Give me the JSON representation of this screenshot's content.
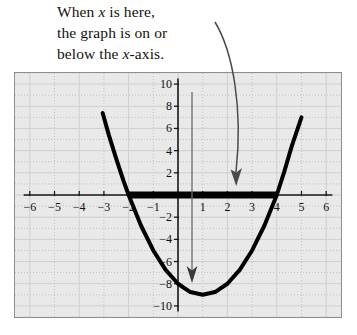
{
  "annotation": {
    "line1_pre": "When ",
    "line1_var": "x",
    "line1_post": " is here,",
    "line2": "the graph is on or",
    "line3_pre": "below the ",
    "line3_var": "x",
    "line3_post": "-axis.",
    "curved_arrow_name": "curved-callout-arrow",
    "vertex_arrow_name": "vertex-pointer-arrow"
  },
  "chart_data": {
    "type": "line",
    "title": "",
    "xlabel": "",
    "ylabel": "",
    "xlim": [
      -6.6,
      6.6
    ],
    "ylim": [
      -11,
      11
    ],
    "grid": true,
    "minor_grid_step": 1,
    "major_grid_step": 2,
    "legend": "none",
    "x_ticks": [
      -6,
      -5,
      -4,
      -3,
      -2,
      -1,
      1,
      2,
      3,
      4,
      5,
      6
    ],
    "x_tick_labels": [
      "−6",
      "−5",
      "−4",
      "−3",
      "−2",
      "−1",
      "1",
      "2",
      "3",
      "4",
      "5",
      "6"
    ],
    "y_ticks": [
      10,
      8,
      6,
      4,
      2,
      -2,
      -4,
      -6,
      -8,
      -10
    ],
    "y_tick_labels": [
      "10",
      "8",
      "6",
      "4",
      "2",
      "−2",
      "−4",
      "−6",
      "−8",
      "−10"
    ],
    "series": [
      {
        "name": "parabola",
        "kind": "parabola",
        "equation": "y = x^2 - 2x - 8",
        "roots": [
          -2,
          4
        ],
        "vertex": [
          1,
          -9
        ],
        "color": "#000000",
        "linewidth": 4,
        "x": [
          -3.05,
          -2.8,
          -2.5,
          -2.2,
          -2.0,
          -1.5,
          -1.0,
          -0.5,
          0.0,
          0.5,
          1.0,
          1.5,
          2.0,
          2.5,
          3.0,
          3.5,
          4.0,
          4.3,
          4.6,
          5.0
        ],
        "values": [
          7.4,
          5.4,
          3.25,
          1.24,
          0.0,
          -2.75,
          -5.0,
          -6.75,
          -8.0,
          -8.75,
          -9.0,
          -8.75,
          -8.0,
          -6.75,
          -5.0,
          -2.75,
          0.0,
          2.09,
          4.36,
          7.0
        ]
      },
      {
        "name": "solution-segment",
        "kind": "segment",
        "description": "thick bar on x-axis where graph is on or below axis",
        "x_start": -2,
        "x_end": 4,
        "y": 0,
        "color": "#000000",
        "linewidth": 7
      }
    ],
    "annotations": [
      {
        "name": "callout",
        "text": "When x is here, the graph is on or below the x-axis.",
        "target_x": 2,
        "target_y": 0
      },
      {
        "name": "vertex-pointer",
        "target_x": 0.3,
        "target_y": -9
      }
    ]
  },
  "colors": {
    "plot_background": "#e9e9e9",
    "frame_border": "#8e8e8e",
    "grid_minor": "#b8b8b8",
    "grid_major": "#cfcfcf",
    "axis": "#1a1a1a",
    "curve": "#000000",
    "arrow": "#4a4a4a",
    "text": "#14110f"
  }
}
